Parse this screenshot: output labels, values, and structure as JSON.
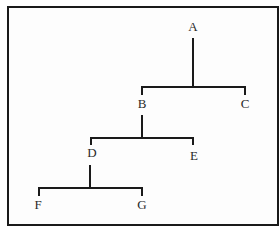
{
  "diagram": {
    "type": "tree",
    "nodes": [
      {
        "id": "A",
        "label": "A",
        "x": 193,
        "y": 31
      },
      {
        "id": "B",
        "label": "B",
        "x": 142,
        "y": 108
      },
      {
        "id": "C",
        "label": "C",
        "x": 245,
        "y": 108
      },
      {
        "id": "D",
        "label": "D",
        "x": 92,
        "y": 157
      },
      {
        "id": "E",
        "label": "E",
        "x": 194,
        "y": 160
      },
      {
        "id": "F",
        "label": "F",
        "x": 38,
        "y": 209
      },
      {
        "id": "G",
        "label": "G",
        "x": 142,
        "y": 209
      }
    ],
    "edges": [
      {
        "from": "A",
        "to": "B"
      },
      {
        "from": "A",
        "to": "C"
      },
      {
        "from": "B",
        "to": "D"
      },
      {
        "from": "B",
        "to": "E"
      },
      {
        "from": "D",
        "to": "F"
      },
      {
        "from": "D",
        "to": "G"
      }
    ],
    "colors": {
      "line": "#1a1a1a",
      "text": "#2a2a2a",
      "background": "#ffffff"
    }
  }
}
